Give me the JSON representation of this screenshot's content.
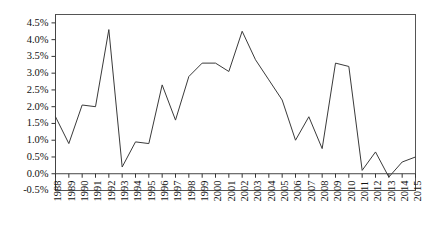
{
  "chart_data": {
    "type": "line",
    "title": "",
    "subtitle": "",
    "xlabel": "",
    "ylabel": "",
    "grid": false,
    "legend": false,
    "legend_position": "none",
    "xlim": [
      1988,
      2015
    ],
    "ylim": [
      -0.5,
      4.75
    ],
    "ytick_labels": [
      "4.5%",
      "4.0%",
      "3.5%",
      "3.0%",
      "2.5%",
      "2.0%",
      "1.5%",
      "1.0%",
      "0.5%",
      "0.0%",
      "-0.5%"
    ],
    "ytick_values": [
      4.5,
      4.0,
      3.5,
      3.0,
      2.5,
      2.0,
      1.5,
      1.0,
      0.5,
      0.0,
      -0.5
    ],
    "categories": [
      "1988",
      "1989",
      "1990",
      "1991",
      "1992",
      "1993",
      "1994",
      "1995",
      "1996",
      "1997",
      "1998",
      "1999",
      "2000",
      "2001",
      "2002",
      "2003",
      "2004",
      "2005",
      "2006",
      "2007",
      "2008",
      "2009",
      "2010",
      "2011",
      "2012",
      "2013",
      "2014",
      "2015"
    ],
    "values": [
      1.7,
      0.9,
      2.05,
      2.0,
      4.3,
      0.2,
      0.95,
      0.9,
      2.65,
      1.6,
      2.9,
      3.3,
      3.3,
      3.05,
      4.25,
      3.4,
      2.8,
      2.2,
      1.0,
      1.7,
      0.75,
      3.3,
      3.2,
      0.1,
      0.65,
      -0.1,
      0.35,
      0.5
    ],
    "series": [
      {
        "name": "series-1",
        "color": "#3a3a3a",
        "values": [
          1.7,
          0.9,
          2.05,
          2.0,
          4.3,
          0.2,
          0.95,
          0.9,
          2.65,
          1.6,
          2.9,
          3.3,
          3.3,
          3.05,
          4.25,
          3.4,
          2.8,
          2.2,
          1.0,
          1.7,
          0.75,
          3.3,
          3.2,
          0.1,
          0.65,
          -0.1,
          0.35,
          0.5
        ]
      }
    ],
    "zero_line": 0.0,
    "colors": {
      "line": "#3a3a3a",
      "axis": "#444444",
      "border": "#555555",
      "text": "#111111",
      "background": "#ffffff"
    }
  }
}
